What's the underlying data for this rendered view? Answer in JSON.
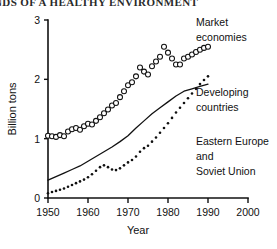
{
  "page": {
    "running_header": "NDS OF A HEALTHY ENVIRONMENT"
  },
  "chart_data": {
    "type": "line",
    "title": "",
    "xlabel": "Year",
    "ylabel": "Billion tons",
    "xlim": [
      1950,
      2000
    ],
    "ylim": [
      0,
      3
    ],
    "xticks": [
      1950,
      1960,
      1970,
      1980,
      1990,
      2000
    ],
    "xtick_labels": [
      "1950",
      "1960",
      "1970",
      "1980",
      "1990",
      "2000"
    ],
    "yticks": [
      0,
      1,
      2,
      3
    ],
    "ytick_labels": [
      "0",
      "1",
      "2",
      "3"
    ],
    "grid": false,
    "legend_position": "inline-right",
    "series": [
      {
        "name": "Market economies",
        "marker": "open-circle",
        "style": "markers",
        "label_lines": [
          "Market",
          "economies"
        ],
        "x": [
          1950,
          1951,
          1952,
          1953,
          1954,
          1955,
          1956,
          1957,
          1958,
          1959,
          1960,
          1961,
          1962,
          1963,
          1964,
          1965,
          1966,
          1967,
          1968,
          1969,
          1970,
          1971,
          1972,
          1973,
          1974,
          1975,
          1976,
          1977,
          1978,
          1979,
          1980,
          1981,
          1982,
          1983,
          1984,
          1985,
          1986,
          1987,
          1988,
          1989,
          1990
        ],
        "values": [
          1.05,
          1.04,
          1.03,
          1.06,
          1.04,
          1.12,
          1.16,
          1.18,
          1.15,
          1.21,
          1.25,
          1.24,
          1.3,
          1.36,
          1.43,
          1.49,
          1.56,
          1.6,
          1.7,
          1.8,
          1.9,
          1.95,
          2.05,
          2.2,
          2.13,
          2.08,
          2.22,
          2.3,
          2.38,
          2.55,
          2.45,
          2.35,
          2.25,
          2.25,
          2.35,
          2.38,
          2.42,
          2.46,
          2.5,
          2.53,
          2.55
        ]
      },
      {
        "name": "Eastern Europe and Soviet Union",
        "marker": "none",
        "style": "solid-line",
        "label_lines": [
          "Eastern Europe",
          "and",
          "Soviet Union"
        ],
        "x": [
          1950,
          1952,
          1954,
          1956,
          1958,
          1960,
          1962,
          1964,
          1966,
          1968,
          1970,
          1972,
          1974,
          1976,
          1978,
          1980,
          1982,
          1984,
          1986,
          1988,
          1990
        ],
        "values": [
          0.3,
          0.36,
          0.42,
          0.48,
          0.54,
          0.62,
          0.7,
          0.78,
          0.86,
          0.95,
          1.05,
          1.18,
          1.3,
          1.42,
          1.52,
          1.62,
          1.72,
          1.8,
          1.84,
          1.88,
          1.92
        ]
      },
      {
        "name": "Developing countries",
        "marker": "dot",
        "style": "dotted",
        "label_lines": [
          "Developing",
          "countries"
        ],
        "x": [
          1950,
          1951,
          1952,
          1953,
          1954,
          1955,
          1956,
          1957,
          1958,
          1959,
          1960,
          1961,
          1962,
          1963,
          1964,
          1965,
          1966,
          1967,
          1968,
          1969,
          1970,
          1971,
          1972,
          1973,
          1974,
          1975,
          1976,
          1977,
          1978,
          1979,
          1980,
          1981,
          1982,
          1983,
          1984,
          1985,
          1986,
          1987,
          1988,
          1989,
          1990
        ],
        "values": [
          0.08,
          0.1,
          0.12,
          0.14,
          0.16,
          0.19,
          0.22,
          0.25,
          0.28,
          0.31,
          0.35,
          0.4,
          0.46,
          0.52,
          0.55,
          0.52,
          0.48,
          0.47,
          0.5,
          0.55,
          0.6,
          0.64,
          0.7,
          0.78,
          0.84,
          0.88,
          0.95,
          1.02,
          1.1,
          1.18,
          1.26,
          1.35,
          1.44,
          1.52,
          1.6,
          1.68,
          1.76,
          1.84,
          1.92,
          1.99,
          2.05
        ]
      }
    ]
  }
}
